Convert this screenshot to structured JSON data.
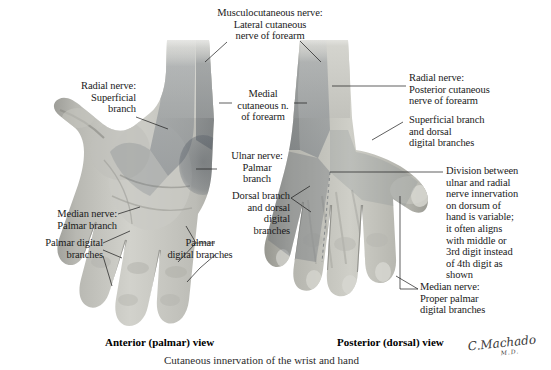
{
  "figure": {
    "caption": "Cutaneous innervation of the wrist and hand",
    "signature_name": "C.Machado",
    "signature_credential": "M.D.",
    "background_color": "#ffffff",
    "text_color": "#1a1a1a"
  },
  "views": {
    "left": {
      "caption": "Anterior (palmar) view"
    },
    "right": {
      "caption": "Posterior (dorsal) view"
    }
  },
  "labels": {
    "musculocutaneous": "Musculocutaneous nerve:\nLateral cutaneous\nnerve of forearm",
    "radial_superficial": "Radial nerve:\nSuperficial\nbranch",
    "medial_cutaneous": "Medial\ncutaneous n.\nof forearm",
    "ulnar_palmar": "Ulnar nerve:\nPalmar\nbranch",
    "dorsal_branch": "Dorsal branch\nand dorsal\ndigital\nbranches",
    "palmar_digital_center": "Palmar\ndigital branches",
    "median_palmar": "Median nerve:\nPalmar branch",
    "palmar_digital_left": "Palmar digital\nbranches",
    "radial_posterior": "Radial nerve:\nPosterior cutaneous\nnerve of forearm",
    "radial_superficial_dorsal": "Superficial branch\nand dorsal\ndigital branches",
    "division_note": "Division between\nulnar and radial\nnerve innervation\non dorsum of\nhand is variable;\nit often aligns\nwith middle or\n3rd digit instead\nof 4th digit as\nshown",
    "median_proper_palmar": "Median nerve:\nProper palmar\ndigital branches"
  },
  "shading_zones": {
    "lateral_cutaneous_forearm": "#b9bcc0",
    "medial_cutaneous_forearm": "#9ea3a9",
    "ulnar_territory": "#8e949b",
    "radial_superficial_territory": "#b3b7bc",
    "median_territory": "#c6c9cd",
    "skin_base": "#cfcfcb",
    "skin_shadow": "#8e8e8a"
  }
}
